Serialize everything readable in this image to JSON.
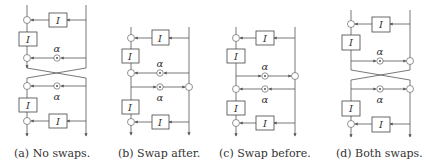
{
  "figure": {
    "box_label": "I",
    "alpha_label": "α",
    "panels": [
      {
        "id": "a",
        "caption": "(a) No swaps.",
        "swap_after": false,
        "swap_before": false
      },
      {
        "id": "b",
        "caption": "(b) Swap after.",
        "swap_after": true,
        "swap_before": false
      },
      {
        "id": "c",
        "caption": "(c) Swap before.",
        "swap_after": false,
        "swap_before": true
      },
      {
        "id": "d",
        "caption": "(d) Both swaps.",
        "swap_after": true,
        "swap_before": true
      }
    ]
  },
  "colors": {
    "line": "#555555",
    "text": "#333333",
    "background": "#ffffff"
  }
}
